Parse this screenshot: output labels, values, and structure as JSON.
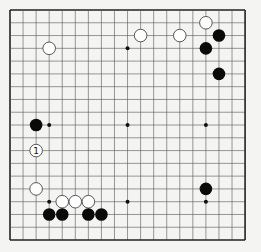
{
  "board": {
    "size": 19,
    "origin": [
      10,
      10
    ],
    "step_x": 13.06,
    "step_y": 12.78,
    "line_color": "#555555",
    "border_color": "#222222",
    "background": "#f4f4f2"
  },
  "hoshi": [
    [
      3,
      3
    ],
    [
      9,
      3
    ],
    [
      15,
      3
    ],
    [
      3,
      9
    ],
    [
      9,
      9
    ],
    [
      15,
      9
    ],
    [
      3,
      15
    ],
    [
      9,
      15
    ],
    [
      15,
      15
    ]
  ],
  "stones": [
    {
      "color": "white",
      "col": 3,
      "row": 3
    },
    {
      "color": "white",
      "col": 10,
      "row": 2
    },
    {
      "color": "white",
      "col": 13,
      "row": 2
    },
    {
      "color": "white",
      "col": 15,
      "row": 1
    },
    {
      "color": "black",
      "col": 16,
      "row": 2
    },
    {
      "color": "black",
      "col": 15,
      "row": 3
    },
    {
      "color": "black",
      "col": 16,
      "row": 5
    },
    {
      "color": "black",
      "col": 2,
      "row": 9
    },
    {
      "color": "white",
      "col": 2,
      "row": 11,
      "label": "1"
    },
    {
      "color": "white",
      "col": 2,
      "row": 14
    },
    {
      "color": "white",
      "col": 4,
      "row": 15
    },
    {
      "color": "white",
      "col": 5,
      "row": 15
    },
    {
      "color": "white",
      "col": 6,
      "row": 15
    },
    {
      "color": "black",
      "col": 3,
      "row": 16
    },
    {
      "color": "black",
      "col": 4,
      "row": 16
    },
    {
      "color": "black",
      "col": 6,
      "row": 16
    },
    {
      "color": "black",
      "col": 7,
      "row": 16
    },
    {
      "color": "black",
      "col": 15,
      "row": 14
    }
  ]
}
